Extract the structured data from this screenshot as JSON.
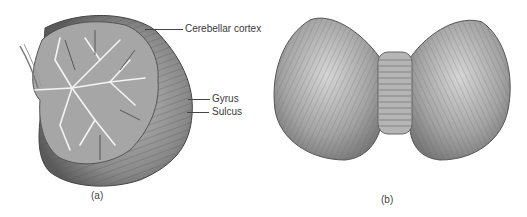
{
  "figure": {
    "panel_a": {
      "caption": "(a)",
      "labels": [
        {
          "text": "Cerebellar cortex"
        },
        {
          "text": "Gyrus"
        },
        {
          "text": "Sulcus"
        }
      ]
    },
    "panel_b": {
      "caption": "(b)"
    }
  }
}
